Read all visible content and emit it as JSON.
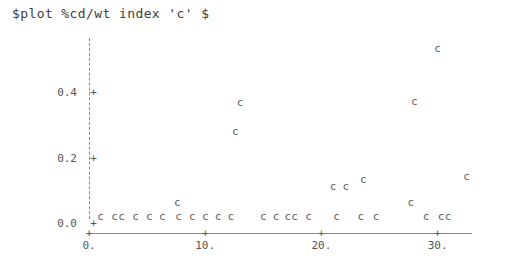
{
  "title": "$plot %cd/wt index 'c' $",
  "colors": {
    "axis": "#8a8a8a",
    "text": "#4a4a4a",
    "marker": "#606060",
    "background": "#ffffff"
  },
  "chart_data": {
    "type": "scatter",
    "title": "$plot %cd/wt index 'c' $",
    "xlabel": "",
    "ylabel": "",
    "marker_symbol": "c",
    "grid": false,
    "legend": null,
    "xlim": [
      -0.8,
      32.9
    ],
    "ylim": [
      -0.02,
      0.58
    ],
    "xticks": [
      0,
      10,
      20,
      30
    ],
    "xticklabels": [
      "0.",
      "10.",
      "20.",
      "30."
    ],
    "yticks": [
      0.0,
      0.2,
      0.4
    ],
    "yticklabels": [
      "0.0",
      "0.2",
      "0.4"
    ],
    "points": [
      {
        "x": 1.0,
        "y": 0.005
      },
      {
        "x": 2.2,
        "y": 0.005
      },
      {
        "x": 2.8,
        "y": 0.005
      },
      {
        "x": 4.0,
        "y": 0.005
      },
      {
        "x": 5.2,
        "y": 0.005
      },
      {
        "x": 6.3,
        "y": 0.005
      },
      {
        "x": 7.6,
        "y": 0.05
      },
      {
        "x": 7.7,
        "y": 0.005
      },
      {
        "x": 8.9,
        "y": 0.005
      },
      {
        "x": 10.0,
        "y": 0.005
      },
      {
        "x": 11.1,
        "y": 0.005
      },
      {
        "x": 12.2,
        "y": 0.005
      },
      {
        "x": 13.0,
        "y": 0.355
      },
      {
        "x": 12.6,
        "y": 0.265
      },
      {
        "x": 15.0,
        "y": 0.005
      },
      {
        "x": 16.1,
        "y": 0.005
      },
      {
        "x": 17.1,
        "y": 0.005
      },
      {
        "x": 17.7,
        "y": 0.005
      },
      {
        "x": 18.9,
        "y": 0.005
      },
      {
        "x": 21.0,
        "y": 0.098
      },
      {
        "x": 22.1,
        "y": 0.098
      },
      {
        "x": 21.3,
        "y": 0.005
      },
      {
        "x": 23.6,
        "y": 0.118
      },
      {
        "x": 23.4,
        "y": 0.005
      },
      {
        "x": 24.7,
        "y": 0.005
      },
      {
        "x": 27.7,
        "y": 0.05
      },
      {
        "x": 28.0,
        "y": 0.357
      },
      {
        "x": 30.0,
        "y": 0.52
      },
      {
        "x": 29.0,
        "y": 0.005
      },
      {
        "x": 30.3,
        "y": 0.005
      },
      {
        "x": 30.9,
        "y": 0.005
      },
      {
        "x": 32.5,
        "y": 0.128
      }
    ]
  }
}
